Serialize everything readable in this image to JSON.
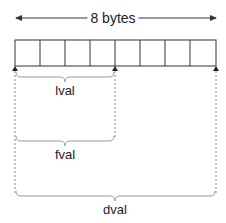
{
  "diagram": {
    "title": "8 bytes",
    "cell_count": 8,
    "labels": {
      "lval": "lval",
      "fval": "fval",
      "dval": "dval"
    },
    "colors": {
      "stroke": "#333333",
      "dashed": "#888888",
      "brace": "#999999"
    }
  }
}
